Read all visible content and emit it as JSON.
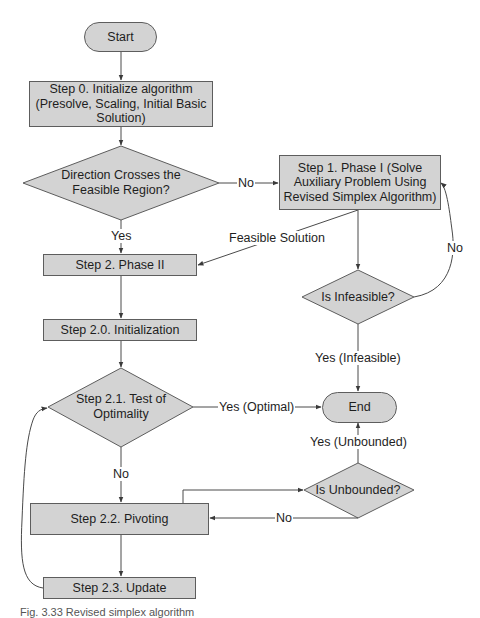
{
  "diagram": {
    "type": "flowchart",
    "colors": {
      "node_fill": "#d3d3d3",
      "node_border": "#5d5d5d",
      "line": "#4a4a4a",
      "background": "#ffffff"
    },
    "nodes": {
      "start": {
        "shape": "terminal",
        "label": "Start"
      },
      "step0": {
        "shape": "process",
        "line1": "Step 0. Initialize algorithm",
        "line2": "(Presolve, Scaling, Initial Basic",
        "line3": "Solution)"
      },
      "decision_direction": {
        "shape": "decision",
        "line1": "Direction Crosses the",
        "line2": "Feasible Region?"
      },
      "step1": {
        "shape": "process",
        "line1": "Step 1. Phase I (Solve",
        "line2": "Auxiliary Problem Using",
        "line3": "Revised Simplex Algorithm)"
      },
      "step2": {
        "shape": "process",
        "label": "Step 2. Phase II"
      },
      "decision_infeasible": {
        "shape": "decision",
        "label": "Is Infeasible?"
      },
      "step2_0": {
        "shape": "process",
        "label": "Step 2.0. Initialization"
      },
      "decision_optimality": {
        "shape": "decision",
        "line1": "Step 2.1. Test of",
        "line2": "Optimality"
      },
      "end": {
        "shape": "terminal",
        "label": "End"
      },
      "decision_unbounded": {
        "shape": "decision",
        "label": "Is Unbounded?"
      },
      "step2_2": {
        "shape": "process",
        "label": "Step 2.2. Pivoting"
      },
      "step2_3": {
        "shape": "process",
        "label": "Step 2.3. Update"
      }
    },
    "edge_labels": {
      "direction_no": "No",
      "direction_yes": "Yes",
      "feasible_solution": "Feasible Solution",
      "infeasible_no": "No",
      "infeasible_yes": "Yes (Infeasible)",
      "optimal_yes": "Yes (Optimal)",
      "optimal_no": "No",
      "unbounded_yes": "Yes (Unbounded)",
      "unbounded_no": "No"
    },
    "edges": [
      {
        "from": "start",
        "to": "step0",
        "label": ""
      },
      {
        "from": "step0",
        "to": "decision_direction",
        "label": ""
      },
      {
        "from": "decision_direction",
        "to": "step1",
        "label": "No"
      },
      {
        "from": "decision_direction",
        "to": "step2",
        "label": "Yes"
      },
      {
        "from": "step1",
        "to": "step2",
        "label": "Feasible Solution"
      },
      {
        "from": "step1",
        "to": "decision_infeasible",
        "label": ""
      },
      {
        "from": "decision_infeasible",
        "to": "step1",
        "label": "No"
      },
      {
        "from": "decision_infeasible",
        "to": "end",
        "label": "Yes (Infeasible)"
      },
      {
        "from": "step2",
        "to": "step2_0",
        "label": ""
      },
      {
        "from": "step2_0",
        "to": "decision_optimality",
        "label": ""
      },
      {
        "from": "decision_optimality",
        "to": "end",
        "label": "Yes (Optimal)"
      },
      {
        "from": "decision_optimality",
        "to": "step2_2",
        "label": "No"
      },
      {
        "from": "step2_2",
        "to": "decision_unbounded",
        "label": ""
      },
      {
        "from": "decision_unbounded",
        "to": "end",
        "label": "Yes (Unbounded)"
      },
      {
        "from": "decision_unbounded",
        "to": "step2_2",
        "label": "No"
      },
      {
        "from": "step2_2",
        "to": "step2_3",
        "label": ""
      },
      {
        "from": "step2_3",
        "to": "decision_optimality",
        "label": ""
      }
    ]
  },
  "caption": "Fig. 3.33  Revised simplex algorithm"
}
